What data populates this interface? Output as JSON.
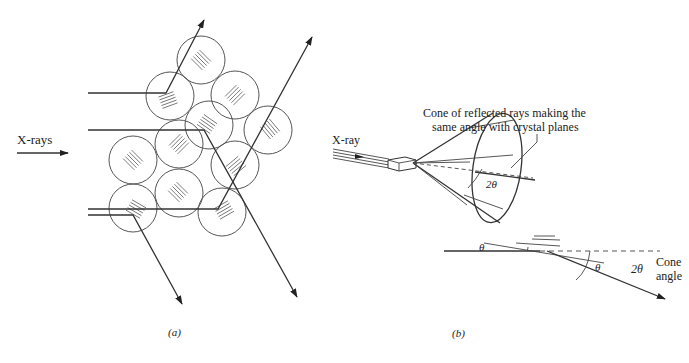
{
  "figure_a": {
    "caption": "(a)",
    "incident_label": "X-rays",
    "description": "Polycrystalline sample of randomly oriented crystal grains diffracting incident X-rays",
    "grain_count": 11
  },
  "figure_b": {
    "caption": "(b)",
    "incident_label": "X-ray",
    "cone_annotation_line1": "Cone of reflected rays making the",
    "cone_annotation_line2": "same angle with crystal planes",
    "cone_angle_symbol": "2θ",
    "theta_symbol_1": "θ",
    "theta_symbol_2": "θ",
    "deflection_angle_symbol": "2θ",
    "cone_angle_label_line1": "Cone",
    "cone_angle_label_line2": "angle"
  },
  "colors": {
    "background": "#ffffff",
    "ink": "#333333"
  }
}
